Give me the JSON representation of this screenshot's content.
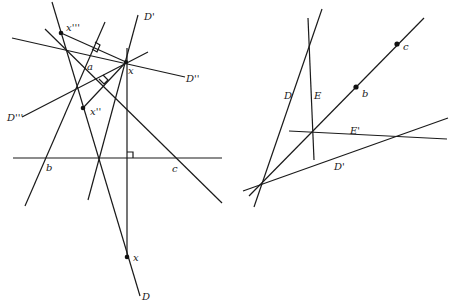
{
  "left_figure": {
    "labels": {
      "D": "D",
      "D_prime": "D'",
      "D_double": "D''",
      "D_triple": "D'''",
      "x_main": "x",
      "x_double": "x''",
      "x_triple": "x'''",
      "x_bottom": "x",
      "a": "a",
      "b": "b",
      "c": "c"
    },
    "points": {
      "x_main": [
        126,
        62
      ],
      "x_double": [
        83,
        108
      ],
      "x_triple": [
        61,
        33
      ],
      "x_bottom": [
        127,
        257
      ]
    },
    "lines": [
      {
        "name": "D",
        "from": [
          52,
          2
        ],
        "to": [
          140,
          296
        ]
      },
      {
        "name": "D'",
        "from": [
          138,
          15
        ],
        "to": [
          88,
          200
        ]
      },
      {
        "name": "D''",
        "from": [
          12,
          38
        ],
        "to": [
          185,
          77
        ]
      },
      {
        "name": "D'''",
        "from": [
          22,
          117
        ],
        "to": [
          148,
          52
        ]
      },
      {
        "name": "vertical",
        "from": [
          127,
          48
        ],
        "to": [
          127,
          257
        ]
      },
      {
        "name": "horizontal-bc",
        "from": [
          13,
          158
        ],
        "to": [
          222,
          158
        ]
      },
      {
        "name": "line-a-c",
        "from": [
          45,
          29
        ],
        "to": [
          222,
          203
        ]
      },
      {
        "name": "line-b",
        "from": [
          105,
          22
        ],
        "to": [
          25,
          206
        ]
      },
      {
        "name": "perp-x-triple",
        "from": [
          61,
          33
        ],
        "to": [
          126,
          62
        ]
      },
      {
        "name": "perp-x-double",
        "from": [
          83,
          108
        ],
        "to": [
          126,
          62
        ]
      }
    ]
  },
  "right_figure": {
    "labels": {
      "D": "D",
      "D_prime": "D'",
      "E": "E",
      "E_prime": "E'",
      "b": "b",
      "c": "c"
    },
    "points": {
      "b": [
        356,
        87
      ],
      "c": [
        397,
        44
      ]
    },
    "lines": [
      {
        "name": "D",
        "from": [
          322,
          9
        ],
        "to": [
          254,
          207
        ]
      },
      {
        "name": "line-bc",
        "from": [
          249,
          196
        ],
        "to": [
          424,
          18
        ]
      },
      {
        "name": "D'",
        "from": [
          243,
          191
        ],
        "to": [
          448,
          118
        ]
      },
      {
        "name": "E",
        "from": [
          308,
          18
        ],
        "to": [
          314,
          160
        ]
      },
      {
        "name": "E'",
        "from": [
          289,
          131
        ],
        "to": [
          447,
          139
        ]
      }
    ]
  }
}
